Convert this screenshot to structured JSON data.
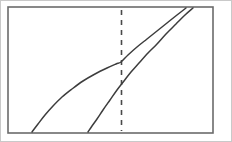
{
  "figure": {
    "title": "",
    "background_color": "#ffffff",
    "width": 232,
    "height": 142
  },
  "frame": {
    "name": "plot-frame",
    "x": 8,
    "y": 7,
    "width": 205,
    "height": 126,
    "stroke_color": "#6b6b6b",
    "stroke_width": 1.6,
    "fill_color": "#ffffff"
  },
  "outer_border": {
    "name": "image-border",
    "stroke_color": "#c9c9c9",
    "stroke_width": 1
  },
  "chart_data": {
    "type": "line",
    "title": "",
    "subtitle": "",
    "xlabel": "",
    "ylabel": "",
    "xlim": [
      8,
      213
    ],
    "ylim": [
      7,
      133
    ],
    "grid": false,
    "legend_position": "none",
    "axis_ticks": {
      "x": [],
      "y": []
    },
    "annotations": [],
    "reference_lines": [
      {
        "name": "vertical-dashed-reference-line",
        "orientation": "vertical",
        "x": 121.5,
        "y_start": 10,
        "y_end": 131,
        "style": "dashed",
        "dash_pattern": "5,5",
        "stroke_color": "#4a4a4a",
        "stroke_width": 1.6,
        "label": ""
      }
    ],
    "series": [
      {
        "name": "upper-curve",
        "label": "",
        "stroke_color": "#3d3d3d",
        "stroke_width": 1.5,
        "style": "solid",
        "points": [
          [
            32,
            132
          ],
          [
            38,
            124
          ],
          [
            45,
            115
          ],
          [
            53,
            106
          ],
          [
            62,
            97
          ],
          [
            72,
            89
          ],
          [
            83,
            81
          ],
          [
            95,
            74
          ],
          [
            107,
            68
          ],
          [
            116,
            64
          ],
          [
            121,
            62
          ],
          [
            128,
            55
          ],
          [
            137,
            47
          ],
          [
            147,
            39
          ],
          [
            157,
            31
          ],
          [
            167,
            23
          ],
          [
            177,
            15
          ],
          [
            186,
            8
          ]
        ]
      },
      {
        "name": "lower-curve",
        "label": "",
        "stroke_color": "#3d3d3d",
        "stroke_width": 1.5,
        "style": "solid",
        "points": [
          [
            88,
            132
          ],
          [
            92,
            126
          ],
          [
            97,
            119
          ],
          [
            103,
            110
          ],
          [
            110,
            100
          ],
          [
            117,
            90
          ],
          [
            124,
            81
          ],
          [
            131,
            72
          ],
          [
            139,
            63
          ],
          [
            148,
            53
          ],
          [
            157,
            44
          ],
          [
            166,
            34
          ],
          [
            176,
            24
          ],
          [
            185,
            15
          ],
          [
            193,
            8
          ]
        ]
      }
    ]
  }
}
